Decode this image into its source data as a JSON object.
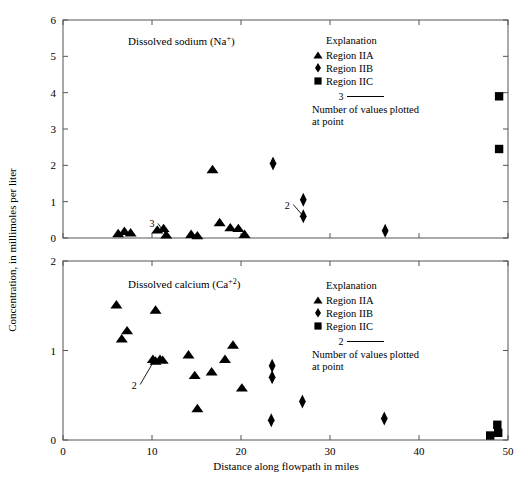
{
  "figure": {
    "axis_x_label": "Distance along flowpath in miles",
    "axis_y_label": "Concentration, in millimoles per liter"
  },
  "legend": {
    "title": "Explanation",
    "items": [
      {
        "symbol": "triangle",
        "label": "Region IIA"
      },
      {
        "symbol": "diamond",
        "label": "Region IIB"
      },
      {
        "symbol": "square",
        "label": "Region IIC"
      }
    ],
    "note_line1": "Number of values plotted",
    "note_line2": "at point",
    "top_count_label": "3",
    "bottom_count_label": "2"
  },
  "chart_data": [
    {
      "type": "scatter",
      "id": "sodium",
      "title": "Dissolved sodium (Na",
      "title_sup": "+",
      "title_end": ")",
      "xlabel": "Distance along flowpath in miles",
      "ylabel": "Concentration, in millimoles per liter",
      "xlim": [
        0,
        50
      ],
      "ylim": [
        0,
        6
      ],
      "xticks": [
        0,
        10,
        20,
        30,
        40,
        50
      ],
      "yticks": [
        0,
        1,
        2,
        3,
        4,
        5,
        6
      ],
      "grid": false,
      "legend_position": "top-right-inside",
      "annotations": [
        {
          "text": "3",
          "x": 10.0,
          "y": 0.4,
          "target_x": 11.6,
          "target_y": 0.08
        },
        {
          "text": "2",
          "x": 25.2,
          "y": 0.92,
          "target_x": 27.0,
          "target_y": 0.6
        }
      ],
      "series": [
        {
          "name": "Region IIA",
          "marker": "triangle",
          "points": [
            {
              "x": 6.2,
              "y": 0.12
            },
            {
              "x": 6.9,
              "y": 0.18
            },
            {
              "x": 7.6,
              "y": 0.14
            },
            {
              "x": 10.6,
              "y": 0.22
            },
            {
              "x": 11.3,
              "y": 0.26
            },
            {
              "x": 11.6,
              "y": 0.08
            },
            {
              "x": 14.4,
              "y": 0.1
            },
            {
              "x": 15.1,
              "y": 0.06
            },
            {
              "x": 16.8,
              "y": 1.88
            },
            {
              "x": 17.6,
              "y": 0.42
            },
            {
              "x": 18.8,
              "y": 0.28
            },
            {
              "x": 19.7,
              "y": 0.26
            },
            {
              "x": 20.4,
              "y": 0.1
            }
          ]
        },
        {
          "name": "Region IIB",
          "marker": "diamond",
          "points": [
            {
              "x": 23.6,
              "y": 2.05
            },
            {
              "x": 27.0,
              "y": 1.05
            },
            {
              "x": 27.0,
              "y": 0.6
            },
            {
              "x": 36.2,
              "y": 0.2
            }
          ]
        },
        {
          "name": "Region IIC",
          "marker": "square",
          "points": [
            {
              "x": 49.0,
              "y": 3.9
            },
            {
              "x": 49.0,
              "y": 2.45
            }
          ]
        }
      ]
    },
    {
      "type": "scatter",
      "id": "calcium",
      "title": "Dissolved calcium (Ca",
      "title_sup": "+2",
      "title_end": ")",
      "xlabel": "Distance along flowpath in miles",
      "ylabel": "Concentration, in millimoles per liter",
      "xlim": [
        0,
        50
      ],
      "ylim": [
        0,
        2
      ],
      "xticks": [
        0,
        10,
        20,
        30,
        40,
        50
      ],
      "yticks": [
        0,
        1,
        2
      ],
      "grid": false,
      "legend_position": "top-right-inside",
      "annotations": [
        {
          "text": "2",
          "x": 8.0,
          "y": 0.62,
          "target_x": 10.2,
          "target_y": 0.88
        }
      ],
      "series": [
        {
          "name": "Region IIA",
          "marker": "triangle",
          "points": [
            {
              "x": 6.0,
              "y": 1.51
            },
            {
              "x": 6.6,
              "y": 1.13
            },
            {
              "x": 7.2,
              "y": 1.22
            },
            {
              "x": 10.4,
              "y": 1.45
            },
            {
              "x": 10.1,
              "y": 0.9
            },
            {
              "x": 10.4,
              "y": 0.88
            },
            {
              "x": 10.9,
              "y": 0.9
            },
            {
              "x": 11.2,
              "y": 0.89
            },
            {
              "x": 14.1,
              "y": 0.95
            },
            {
              "x": 14.8,
              "y": 0.72
            },
            {
              "x": 15.1,
              "y": 0.35
            },
            {
              "x": 16.7,
              "y": 0.76
            },
            {
              "x": 18.2,
              "y": 0.9
            },
            {
              "x": 19.1,
              "y": 1.06
            },
            {
              "x": 20.1,
              "y": 0.58
            }
          ]
        },
        {
          "name": "Region IIB",
          "marker": "diamond",
          "points": [
            {
              "x": 23.5,
              "y": 0.83
            },
            {
              "x": 23.5,
              "y": 0.7
            },
            {
              "x": 23.4,
              "y": 0.22
            },
            {
              "x": 26.9,
              "y": 0.43
            },
            {
              "x": 36.1,
              "y": 0.24
            }
          ]
        },
        {
          "name": "Region IIC",
          "marker": "square",
          "points": [
            {
              "x": 48.0,
              "y": 0.05
            },
            {
              "x": 48.8,
              "y": 0.17
            },
            {
              "x": 48.9,
              "y": 0.08
            }
          ]
        }
      ]
    }
  ]
}
